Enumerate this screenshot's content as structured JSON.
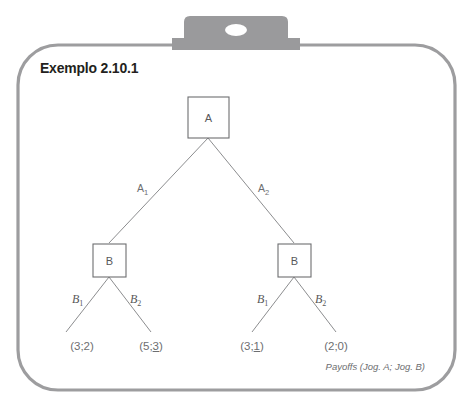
{
  "page": {
    "title": "Exemplo 2.10.1",
    "caption": "Payoffs (Jog. A; Jog. B)"
  },
  "colors": {
    "frame_border": "#9d9d9f",
    "clip_fill": "#9a9a9c",
    "node_border": "#6d6e70",
    "edge_line": "#8c8d8f",
    "text_dark": "#231f20",
    "text_gray": "#58585a",
    "background": "#ffffff"
  },
  "tree": {
    "root": {
      "label": "A",
      "name": "decision-node-a"
    },
    "root_edges": [
      {
        "label": "A",
        "sub": "1",
        "name": "edge-label-a1"
      },
      {
        "label": "A",
        "sub": "2",
        "name": "edge-label-a2"
      }
    ],
    "second_level": [
      {
        "label": "B",
        "name": "decision-node-b-left"
      },
      {
        "label": "B",
        "name": "decision-node-b-right"
      }
    ],
    "branch_edges": [
      {
        "label": "B",
        "sub": "1",
        "name": "edge-label-b1-left"
      },
      {
        "label": "B",
        "sub": "2",
        "name": "edge-label-b2-left"
      },
      {
        "label": "B",
        "sub": "1",
        "name": "edge-label-b1-right"
      },
      {
        "label": "B",
        "sub": "2",
        "name": "edge-label-b2-right"
      }
    ],
    "payoffs": [
      {
        "text": "(3;2)",
        "a": "3",
        "b": "2",
        "underlined": null,
        "name": "payoff-leaf-1"
      },
      {
        "text": "(5;3)",
        "a": "5",
        "b": "3",
        "underlined": "b",
        "name": "payoff-leaf-2"
      },
      {
        "text": "(3;1)",
        "a": "3",
        "b": "1",
        "underlined": "b",
        "name": "payoff-leaf-3"
      },
      {
        "text": "(2;0)",
        "a": "2",
        "b": "0",
        "underlined": null,
        "name": "payoff-leaf-4"
      }
    ]
  }
}
